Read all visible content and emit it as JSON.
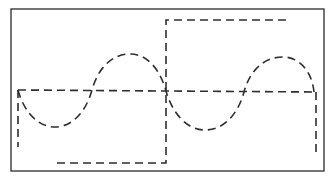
{
  "diagram": {
    "colors": {
      "background": "#ffffff",
      "stroke": "#2e2e2e",
      "frame": "#2a2a2a"
    },
    "elements": [
      {
        "name": "frame",
        "type": "rectangle",
        "style": "solid"
      },
      {
        "name": "baseline",
        "type": "horizontal-line",
        "style": "dashed"
      },
      {
        "name": "sine-wave",
        "type": "sine",
        "style": "dashed",
        "cycles": 2,
        "start_phase": "negative-half-first"
      },
      {
        "name": "square-wave",
        "type": "square",
        "style": "dashed",
        "transitions": 1,
        "low_half_then_high_half": true
      }
    ]
  }
}
